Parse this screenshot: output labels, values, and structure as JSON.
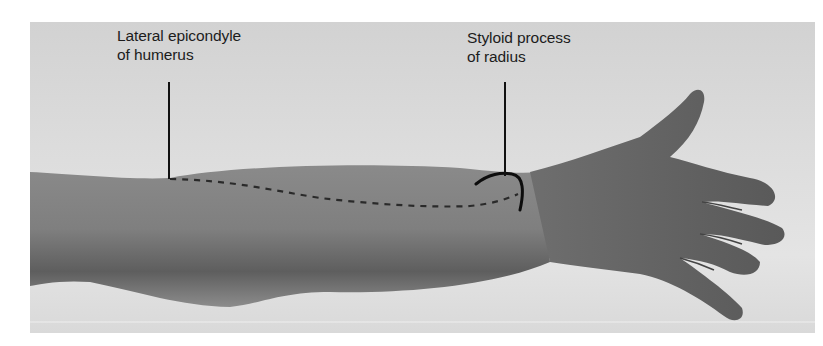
{
  "figure": {
    "labels": [
      {
        "id": "lateral-epicondyle",
        "lines": [
          "Lateral epicondyle",
          "of humerus"
        ]
      },
      {
        "id": "styloid-process",
        "lines": [
          "Styloid process",
          "of radius"
        ]
      }
    ],
    "markings": {
      "dashed_line": "line between lateral epicondyle of humerus and styloid process of radius",
      "arc": "outline of styloid process of radius"
    },
    "colors": {
      "background": "#ffffff",
      "photo_bg": "#dcdcdc",
      "skin": "#7a7a7a",
      "ink": "#111111",
      "label_text": "#1c1c1c"
    }
  }
}
